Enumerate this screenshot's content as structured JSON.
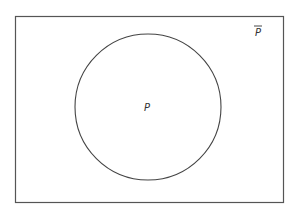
{
  "diagram": {
    "type": "venn",
    "universe": {
      "label": "P",
      "label_overline": true,
      "description": "complement of P",
      "rect": {
        "x": 15,
        "y": 16,
        "width": 268,
        "height": 186
      }
    },
    "sets": [
      {
        "label": "P",
        "circle": {
          "cx": 148,
          "cy": 107,
          "r": 73
        }
      }
    ],
    "colors": {
      "stroke": "#444444",
      "background": "#ffffff",
      "text": "#333333"
    }
  }
}
